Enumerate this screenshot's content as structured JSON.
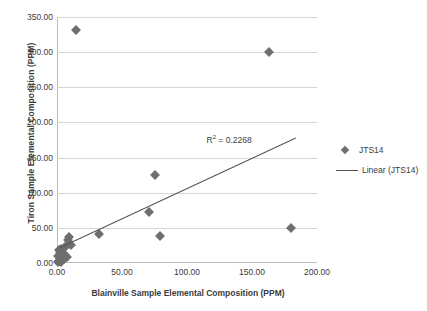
{
  "chart_data": {
    "type": "scatter",
    "title": "",
    "xlabel": "Blainville Sample Elemental Composition (PPM)",
    "ylabel": "Tiron Sample Elemental Composition (PPM)",
    "xlim": [
      0,
      200
    ],
    "ylim": [
      0,
      350
    ],
    "xticks": [
      "0.00",
      "50.00",
      "100.00",
      "150.00",
      "200.00"
    ],
    "yticks": [
      "0.00",
      "50.00",
      "100.00",
      "150.00",
      "200.00",
      "250.00",
      "300.00",
      "350.00"
    ],
    "grid": "horizontal",
    "legend_position": "right",
    "annotations": [
      {
        "name": "r-squared",
        "text": "R² = 0.2268",
        "value": 0.2268,
        "x": 115,
        "y": 175
      }
    ],
    "series": [
      {
        "name": "JTS14",
        "type": "scatter",
        "marker": "diamond",
        "color": "#6e6e6e",
        "points": [
          [
            14.5,
            332
          ],
          [
            163,
            300
          ],
          [
            75,
            125
          ],
          [
            71,
            72
          ],
          [
            32,
            41
          ],
          [
            79,
            38
          ],
          [
            180,
            50
          ],
          [
            9.5,
            37
          ],
          [
            8.5,
            33
          ],
          [
            10.5,
            26
          ],
          [
            7.5,
            25
          ],
          [
            5.5,
            22
          ],
          [
            3.0,
            20
          ],
          [
            1.5,
            18
          ],
          [
            2.5,
            15
          ],
          [
            4.5,
            14
          ],
          [
            6.5,
            12
          ],
          [
            1.0,
            10
          ],
          [
            3.5,
            9
          ],
          [
            8.0,
            8
          ],
          [
            2.0,
            6
          ],
          [
            5.0,
            5
          ],
          [
            1.2,
            3
          ],
          [
            3.2,
            2
          ],
          [
            0.8,
            1
          ]
        ]
      },
      {
        "name": "Linear (JTS14)",
        "type": "line",
        "color": "#545454",
        "trendline": {
          "x0": 0.5,
          "y0": 21,
          "x1": 183,
          "y1": 178
        }
      }
    ],
    "legend_entries": [
      {
        "label": "JTS14",
        "marker": "diamond"
      },
      {
        "label": "Linear (JTS14)",
        "marker": "line"
      }
    ]
  }
}
